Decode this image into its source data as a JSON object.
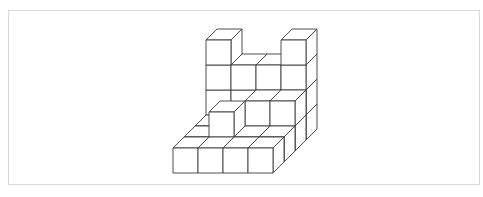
{
  "figure": {
    "style": {
      "line_color": "#3a3a3a",
      "background": "#ffffff",
      "frame_color": "#d9d9d9"
    },
    "projection": {
      "cube_size": 25,
      "depth_dx": 11,
      "depth_dy": -11,
      "origin": [
        173,
        173
      ]
    },
    "cubes": [
      [
        0,
        0,
        0
      ],
      [
        1,
        0,
        0
      ],
      [
        2,
        0,
        0
      ],
      [
        3,
        0,
        0
      ],
      [
        0,
        1,
        0
      ],
      [
        1,
        1,
        0
      ],
      [
        2,
        1,
        0
      ],
      [
        3,
        1,
        0
      ],
      [
        0,
        2,
        0
      ],
      [
        1,
        2,
        0
      ],
      [
        2,
        2,
        0
      ],
      [
        3,
        2,
        0
      ],
      [
        0,
        3,
        0
      ],
      [
        1,
        3,
        0
      ],
      [
        2,
        3,
        0
      ],
      [
        3,
        3,
        0
      ],
      [
        1,
        1,
        1
      ],
      [
        2,
        2,
        1
      ],
      [
        3,
        2,
        1
      ],
      [
        2,
        3,
        1
      ],
      [
        3,
        3,
        1
      ],
      [
        1,
        3,
        1
      ],
      [
        0,
        3,
        1
      ],
      [
        1,
        3,
        2
      ],
      [
        3,
        3,
        2
      ],
      [
        3,
        3,
        3
      ],
      [
        3,
        3,
        1
      ],
      [
        0,
        3,
        2
      ],
      [
        0,
        3,
        3
      ],
      [
        2,
        3,
        2
      ]
    ]
  }
}
